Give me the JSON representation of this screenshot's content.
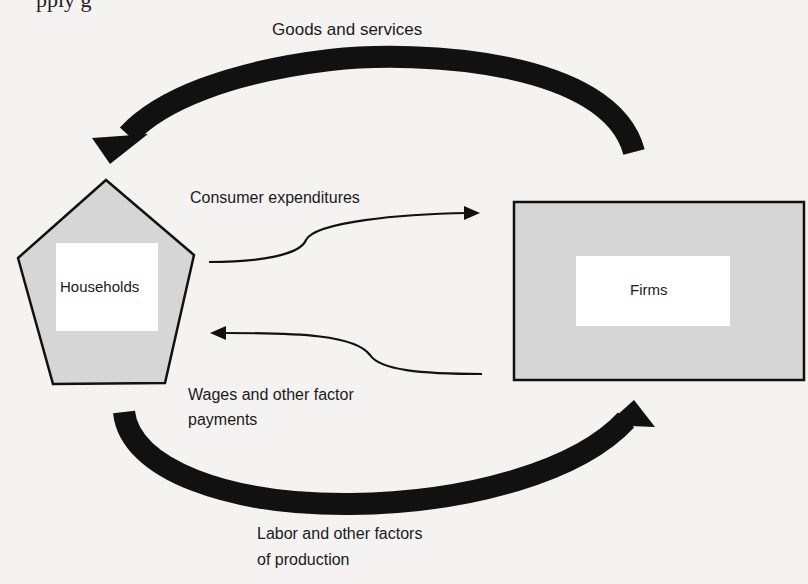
{
  "diagram": {
    "type": "circular-flow",
    "nodes": {
      "households": {
        "label": "Households",
        "shape": "pentagon",
        "fill": "#d6d6d6",
        "inner_fill": "#ffffff"
      },
      "firms": {
        "label": "Firms",
        "shape": "rectangle",
        "fill": "#d6d6d6",
        "inner_fill": "#ffffff"
      }
    },
    "flows": {
      "goods_services": {
        "label": "Goods and services",
        "from": "Firms",
        "to": "Households",
        "style": "thick"
      },
      "consumer_expenditures": {
        "label": "Consumer expenditures",
        "from": "Households",
        "to": "Firms",
        "style": "thin"
      },
      "wages": {
        "line1": "Wages and other factor",
        "line2": "payments",
        "from": "Firms",
        "to": "Households",
        "style": "thin"
      },
      "labor": {
        "line1": "Labor and other factors",
        "line2": "of production",
        "from": "Households",
        "to": "Firms",
        "style": "thick"
      }
    },
    "clipped_top_text": "pply g"
  }
}
